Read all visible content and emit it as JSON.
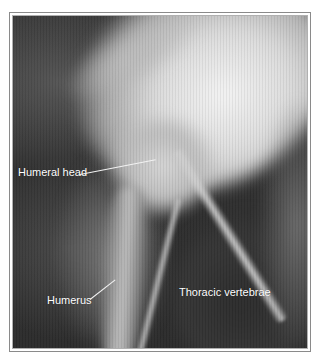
{
  "figure": {
    "type": "radiograph",
    "frame_color": "#8a8a8a",
    "labels": [
      {
        "text": "Humeral head",
        "x": 16,
        "y": 172
      },
      {
        "text": "Humerus",
        "x": 46,
        "y": 265
      },
      {
        "text": "Thoracic vertebrae",
        "x": 150,
        "y": 288
      }
    ]
  }
}
